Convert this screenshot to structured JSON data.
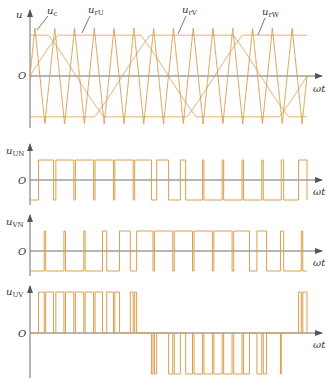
{
  "figure": {
    "colors": {
      "waveform": "#d9a050",
      "axis": "#6e6e6e",
      "label": "#333333",
      "background": "#ffffff"
    },
    "panels": [
      {
        "id": "carrier-reference",
        "y_label": "u",
        "x_label": "ωt",
        "origin_label": "O",
        "curve_labels": [
          {
            "id": "carrier",
            "base": "u",
            "sub": "c"
          },
          {
            "id": "ref-u",
            "base": "u",
            "sub": "rU"
          },
          {
            "id": "ref-v",
            "base": "u",
            "sub": "rV"
          },
          {
            "id": "ref-w",
            "base": "u",
            "sub": "rW"
          }
        ]
      },
      {
        "id": "u-un",
        "y_label_base": "u",
        "y_label_sub": "UN",
        "x_label": "ωt",
        "origin_label": "O"
      },
      {
        "id": "u-vn",
        "y_label_base": "u",
        "y_label_sub": "VN",
        "x_label": "ωt",
        "origin_label": "O"
      },
      {
        "id": "u-uv",
        "y_label_base": "u",
        "y_label_sub": "UV",
        "x_label": "ωt",
        "origin_label": "O"
      }
    ]
  },
  "chart_data": {
    "type": "line",
    "title": "",
    "xlabel": "ωt",
    "carrier": {
      "shape": "triangle",
      "periods": 14,
      "amplitude": 1.0
    },
    "references": [
      {
        "name": "u_rU",
        "shape": "trapezoid",
        "phase_deg": 0,
        "amplitude": 0.85
      },
      {
        "name": "u_rV",
        "shape": "trapezoid",
        "phase_deg": -120,
        "amplitude": 0.85
      },
      {
        "name": "u_rW",
        "shape": "trapezoid",
        "phase_deg": -240,
        "amplitude": 0.85
      }
    ],
    "outputs": [
      {
        "name": "u_UN",
        "levels": [
          "+Ud/2",
          "-Ud/2"
        ]
      },
      {
        "name": "u_VN",
        "levels": [
          "+Ud/2",
          "-Ud/2"
        ]
      },
      {
        "name": "u_UV",
        "levels": [
          "+Ud",
          "0",
          "-Ud"
        ]
      }
    ]
  }
}
